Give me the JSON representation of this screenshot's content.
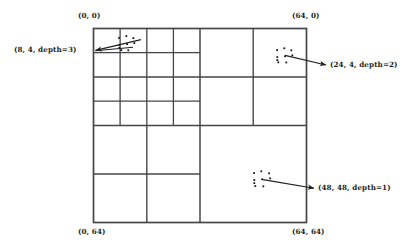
{
  "figure": {
    "type": "quadtree-subdivision-diagram",
    "domain_extent": 64,
    "stroke_color": "#44464a",
    "dot_color": "#1a1a1a",
    "background_color": "#ffffff"
  },
  "corner_labels": [
    {
      "id": "top-left",
      "text": "(0, 0)",
      "x": 78,
      "y": 12
    },
    {
      "id": "top-right",
      "text": "(64, 0)",
      "x": 292,
      "y": 12
    },
    {
      "id": "bottom-left",
      "text": "(0, 64)",
      "x": 78,
      "y": 228
    },
    {
      "id": "bottom-right",
      "text": "(64, 64)",
      "x": 292,
      "y": 228
    }
  ],
  "callouts": [
    {
      "id": "callout-8-4-depth3",
      "text": "(8, 4, depth=3)",
      "label_x": 14,
      "label_y": 46,
      "arrow_tip": {
        "x": 94,
        "y": 51
      },
      "arrow_tail": {
        "x": 140,
        "y": 40
      },
      "arrow_tail2": {
        "x": 133,
        "y": 47
      },
      "cell_coord": [
        8,
        4
      ],
      "depth": 3
    },
    {
      "id": "callout-24-4-depth2",
      "text": "(24, 4, depth=2)",
      "label_x": 330,
      "label_y": 62,
      "arrow_tip": {
        "x": 327,
        "y": 65
      },
      "arrow_tail": {
        "x": 285,
        "y": 55
      },
      "cell_coord": [
        24,
        4
      ],
      "depth": 2
    },
    {
      "id": "callout-48-48-depth1",
      "text": "(48, 48, depth=1)",
      "label_x": 318,
      "label_y": 185,
      "arrow_tip": {
        "x": 315,
        "y": 188
      },
      "arrow_tail": {
        "x": 263,
        "y": 180
      },
      "cell_coord": [
        48,
        48
      ],
      "depth": 1
    }
  ],
  "grid": {
    "x0": 93.5,
    "y0": 28.5,
    "x1": 306.5,
    "y1": 222.5,
    "outer_stroke_width": 1.6,
    "inner_stroke_width": 1.2,
    "quadrants": [
      {
        "id": "top-left",
        "divisions": 4,
        "note": "subdivided to depth 3"
      },
      {
        "id": "top-right",
        "divisions": 2,
        "note": "subdivided to depth 2"
      },
      {
        "id": "bottom-left",
        "divisions": 2,
        "note": "subdivided to depth 2"
      },
      {
        "id": "bottom-right",
        "divisions": 1,
        "note": "leaf cell at depth 1"
      }
    ],
    "extra_lines": [
      {
        "id": "tl-extra-h-upper-right",
        "note": "half line across top-left quadrant row 1 only"
      }
    ]
  },
  "dot_clusters": [
    {
      "id": "cluster-8-4",
      "center": {
        "x": 127,
        "y": 44
      },
      "points": [
        {
          "x": 119,
          "y": 38
        },
        {
          "x": 126,
          "y": 36
        },
        {
          "x": 133,
          "y": 38
        },
        {
          "x": 119,
          "y": 45
        },
        {
          "x": 127,
          "y": 44
        },
        {
          "x": 134,
          "y": 43
        },
        {
          "x": 121,
          "y": 50
        },
        {
          "x": 128,
          "y": 50
        }
      ]
    },
    {
      "id": "cluster-24-4",
      "center": {
        "x": 285,
        "y": 56
      },
      "points": [
        {
          "x": 277,
          "y": 50
        },
        {
          "x": 284,
          "y": 48
        },
        {
          "x": 291,
          "y": 50
        },
        {
          "x": 277,
          "y": 57
        },
        {
          "x": 285,
          "y": 56
        },
        {
          "x": 292,
          "y": 55
        },
        {
          "x": 278,
          "y": 62
        },
        {
          "x": 286,
          "y": 62
        }
      ]
    },
    {
      "id": "cluster-48-48",
      "center": {
        "x": 263,
        "y": 180
      },
      "points": [
        {
          "x": 254,
          "y": 173
        },
        {
          "x": 261,
          "y": 171
        },
        {
          "x": 269,
          "y": 173
        },
        {
          "x": 254,
          "y": 180
        },
        {
          "x": 262,
          "y": 179
        },
        {
          "x": 270,
          "y": 178
        },
        {
          "x": 255,
          "y": 186
        },
        {
          "x": 263,
          "y": 186
        }
      ]
    }
  ]
}
